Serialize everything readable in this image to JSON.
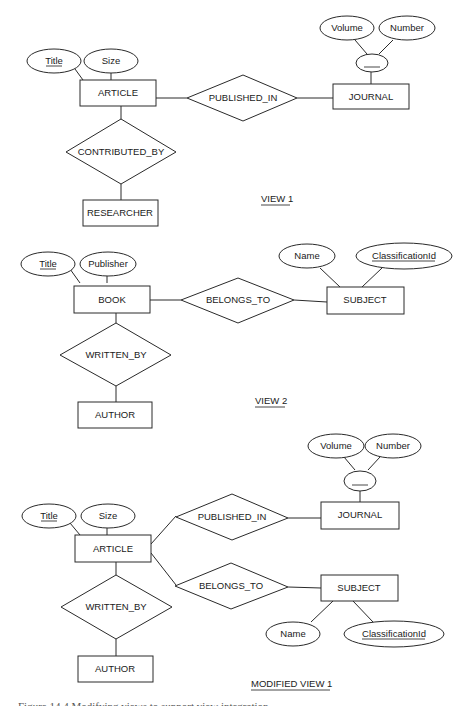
{
  "view1": {
    "label": "VIEW 1",
    "entities": {
      "article": "ARTICLE",
      "journal": "JOURNAL",
      "researcher": "RESEARCHER"
    },
    "relationships": {
      "published_in": "PUBLISHED_IN",
      "contributed_by": "CONTRIBUTED_BY"
    },
    "attributes": {
      "title": "Title",
      "size": "Size",
      "volume": "Volume",
      "number": "Number",
      "composite_key": "____"
    }
  },
  "view2": {
    "label": "VIEW 2",
    "entities": {
      "book": "BOOK",
      "subject": "SUBJECT",
      "author": "AUTHOR"
    },
    "relationships": {
      "belongs_to": "BELONGS_TO",
      "written_by": "WRITTEN_BY"
    },
    "attributes": {
      "title": "Title",
      "publisher": "Publisher",
      "name": "Name",
      "classification_id": "ClassificationId"
    }
  },
  "modified_view1": {
    "label": "MODIFIED VIEW 1",
    "entities": {
      "article": "ARTICLE",
      "journal": "JOURNAL",
      "subject": "SUBJECT",
      "author": "AUTHOR"
    },
    "relationships": {
      "published_in": "PUBLISHED_IN",
      "belongs_to": "BELONGS_TO",
      "written_by": "WRITTEN_BY"
    },
    "attributes": {
      "title": "Title",
      "size": "Size",
      "volume": "Volume",
      "number": "Number",
      "composite_key": "____",
      "name": "Name",
      "classification_id": "ClassificationId"
    }
  },
  "caption": "Figure 14.4   Modifying views to support view integration."
}
